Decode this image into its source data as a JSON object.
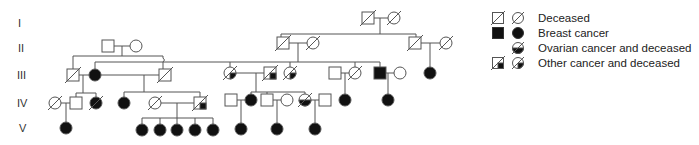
{
  "generations": [
    {
      "label": "I",
      "y": 24
    },
    {
      "label": "II",
      "y": 49
    },
    {
      "label": "III",
      "y": 76
    },
    {
      "label": "IV",
      "y": 104
    },
    {
      "label": "V",
      "y": 130
    }
  ],
  "legend": {
    "items": [
      {
        "symbols": [
          "square-deceased",
          "circle-deceased"
        ],
        "label": "Deceased"
      },
      {
        "symbols": [
          "square-breast-cancer",
          "circle-breast-cancer"
        ],
        "label": "Breast cancer"
      },
      {
        "symbols": [
          "circle-ovarian-cancer-deceased"
        ],
        "label": "Ovarian cancer and deceased"
      },
      {
        "symbols": [
          "square-other-cancer-deceased",
          "circle-other-cancer-deceased"
        ],
        "label": "Other  cancer and deceased"
      }
    ]
  },
  "colors": {
    "line": "#555555",
    "fill": "#111111",
    "background": "#ffffff"
  }
}
